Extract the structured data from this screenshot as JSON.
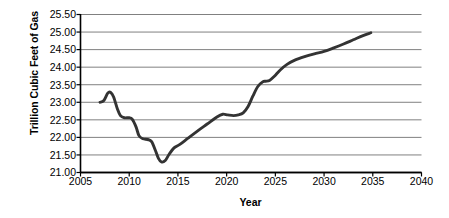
{
  "chart_data": {
    "type": "line",
    "title": "",
    "xlabel": "Year",
    "ylabel": "Trillion Cubic Feet of Gas",
    "xlim": [
      2005,
      2040
    ],
    "ylim": [
      21.0,
      25.5
    ],
    "grid": "horizontal",
    "legend": "none",
    "line_color": "#333333",
    "gridline_color": "#808080",
    "axis_color": "#000000",
    "xticks": [
      "2005",
      "2010",
      "2015",
      "2020",
      "2025",
      "2030",
      "2035",
      "2040"
    ],
    "xtick_values": [
      2005,
      2010,
      2015,
      2020,
      2025,
      2030,
      2035,
      2040
    ],
    "yticks": [
      "21.00",
      "21.50",
      "22.00",
      "22.50",
      "23.00",
      "23.50",
      "24.00",
      "24.50",
      "25.00",
      "25.50"
    ],
    "ytick_values": [
      21.0,
      21.5,
      22.0,
      22.5,
      23.0,
      23.5,
      24.0,
      24.5,
      25.0,
      25.5
    ],
    "series": [
      {
        "name": "Natural gas consumption",
        "x": [
          2007.0,
          2007.4,
          2007.8,
          2008.1,
          2008.4,
          2008.8,
          2009.1,
          2009.5,
          2010.0,
          2010.3,
          2010.7,
          2011.0,
          2011.4,
          2011.9,
          2012.3,
          2012.7,
          2013.0,
          2013.3,
          2013.7,
          2014.1,
          2014.6,
          2015.2,
          2016.0,
          2017.0,
          2018.0,
          2019.0,
          2019.6,
          2020.1,
          2020.7,
          2021.2,
          2021.7,
          2022.2,
          2022.7,
          2023.2,
          2023.7,
          2024.0,
          2024.4,
          2024.9,
          2025.5,
          2026.2,
          2027.0,
          2028.0,
          2029.0,
          2030.0,
          2031.0,
          2032.0,
          2033.0,
          2034.0,
          2034.8
        ],
        "y": [
          23.0,
          23.05,
          23.26,
          23.28,
          23.15,
          22.8,
          22.62,
          22.56,
          22.56,
          22.52,
          22.3,
          22.05,
          21.96,
          21.94,
          21.88,
          21.62,
          21.4,
          21.3,
          21.34,
          21.52,
          21.7,
          21.8,
          21.97,
          22.18,
          22.38,
          22.58,
          22.66,
          22.64,
          22.62,
          22.64,
          22.7,
          22.88,
          23.18,
          23.45,
          23.58,
          23.6,
          23.62,
          23.74,
          23.92,
          24.08,
          24.2,
          24.3,
          24.38,
          24.45,
          24.55,
          24.66,
          24.78,
          24.9,
          24.98
        ]
      }
    ]
  }
}
